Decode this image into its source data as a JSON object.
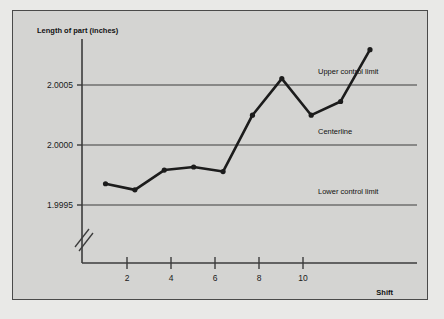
{
  "chart_data": {
    "type": "line",
    "title": "",
    "subtitle": "",
    "xlabel": "Shift",
    "ylabel": "Length of part (inches)",
    "x": [
      1,
      2,
      3,
      4,
      5,
      6,
      7,
      8,
      9,
      10
    ],
    "values": [
      1.99977,
      1.99973,
      1.99986,
      1.99988,
      1.99985,
      2.00022,
      2.00046,
      2.00022,
      2.00031,
      2.00065
    ],
    "series": [
      {
        "name": "Length of part",
        "values": [
          1.99977,
          1.99973,
          1.99986,
          1.99988,
          1.99985,
          2.00022,
          2.00046,
          2.00022,
          2.00031,
          2.00065
        ]
      }
    ],
    "xlim": [
      0.2,
      11.6
    ],
    "ylim": [
      1.99925,
      2.00072
    ],
    "xticks": [
      2,
      4,
      6,
      8,
      10
    ],
    "xtick_labels": [
      "2",
      "4",
      "6",
      "8",
      "10"
    ],
    "yticks": [
      2.0005,
      2.0,
      1.9995
    ],
    "ytick_labels": [
      "2.0005",
      "2.0000",
      "1.9995"
    ],
    "grid": false,
    "legend": "none",
    "axis_break": true,
    "annotations": [
      {
        "name": "upper-control-limit",
        "label": "Upper control limit",
        "value": 2.0005
      },
      {
        "name": "centerline",
        "label": "Centerline",
        "value": 2.0
      },
      {
        "name": "lower-control-limit",
        "label": "Lower control limit",
        "value": 1.9995
      }
    ],
    "colors": {
      "background": "#d4d4d2",
      "page": "#e9e9e7",
      "series": "#1c1c1c",
      "axis": "#3c3c3c",
      "limit_line": "#3c3c3c",
      "text": "#111111"
    }
  }
}
